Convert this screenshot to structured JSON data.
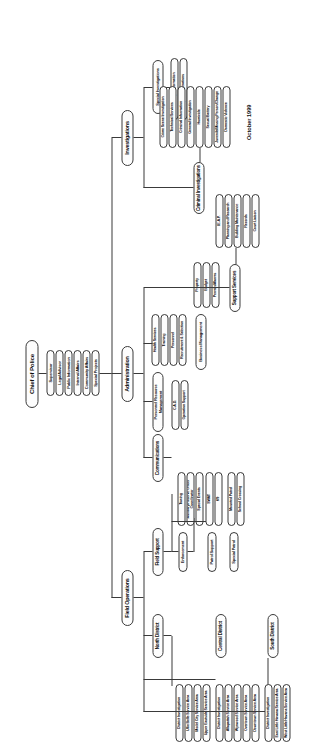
{
  "chart": {
    "title": "Chief of Police",
    "datestamp": "October 1999",
    "root": "Chief of Police",
    "chief_staff": [
      "Supervisor",
      "Legal Advisor",
      "Public Information",
      "Internal Affairs",
      "Community Affairs",
      "Special Projects"
    ],
    "divisions": [
      "Field Operations",
      "Administration",
      "Investigations"
    ],
    "field_operations": {
      "label": "Field Operations",
      "branches": [
        "Field Support",
        "North District",
        "Central District",
        "South District"
      ],
      "field_support": {
        "label": "Field Support",
        "children": [
          "Enforcement",
          "Patrol Support",
          "Special Patrol"
        ],
        "enforcement": [
          "Towing",
          "Auxiliary/Reserve Officer Coordinator",
          "Special Events"
        ],
        "patrol_support": [
          "SWAT",
          "K9"
        ],
        "special_patrol": [
          "Mounted Patrol",
          "School Crossing"
        ]
      },
      "north_district": {
        "label": "North District",
        "children": [
          "District Investigation",
          "Ullie Belle Service Area",
          "Model City Service Area",
          "Upper Eastside Service Area"
        ]
      },
      "central_district": {
        "label": "Central District",
        "children": [
          "District Investigation",
          "Allapattah Service Area",
          "Wynwood Service Area",
          "Overtown Service Area",
          "Downtown Service Area"
        ]
      },
      "south_district": {
        "label": "South District",
        "children": [
          "District Investigation",
          "East Little Havana Service Area",
          "West Little Havana Service Area",
          "Flagami Service Area",
          "Coral Way Service Area",
          "Coconut Grove Service Area"
        ]
      }
    },
    "administration": {
      "label": "Administration",
      "children": [
        "Communications",
        "Personnel Resource Management",
        "Business Management",
        "Support Services"
      ],
      "communications": {
        "label": "Communications",
        "children": [
          "C.A.D.",
          "Operation Support"
        ]
      },
      "personnel_resource_management": {
        "label": "Personnel Resource Management",
        "children": [
          "Health Services",
          "Training",
          "Personnel",
          "Recruitment & Selection"
        ]
      },
      "business_management": {
        "label": "Business Management",
        "children": [
          "Property",
          "Budget",
          "Permits/Alarms"
        ]
      },
      "support_services": {
        "label": "Support Services",
        "children": [
          "I.E.A.P.",
          "Planning and Research",
          "Building Maintenance",
          "Records",
          "Court Liaison"
        ]
      }
    },
    "investigations": {
      "label": "Investigations",
      "children": [
        "Criminal Investigations",
        "Special Investigations"
      ],
      "criminal_investigations": {
        "label": "Criminal Investigations",
        "children": [
          "Crime Scene Investigation",
          "Technical Services",
          "Criminal Information",
          "General Investigation",
          "Homicide",
          "Sexual Battery",
          "Juvenile/Missing Person/Change",
          "Domestic Violence"
        ]
      },
      "special_investigations": {
        "label": "Special Investigations",
        "children": [
          "Strategic Information",
          "Special Operations"
        ]
      }
    }
  }
}
